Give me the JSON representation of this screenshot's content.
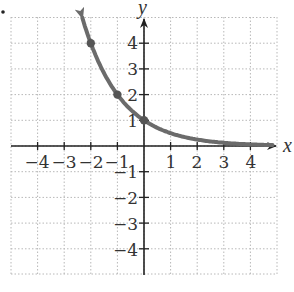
{
  "chart_data": {
    "type": "line",
    "title": "",
    "function": "y = (1/2)^x",
    "xlabel": "x",
    "ylabel": "y",
    "xlim": [
      -5,
      5
    ],
    "ylim": [
      -5,
      5
    ],
    "grid": true,
    "grid_style": "dotted",
    "x_ticks": [
      -4,
      -3,
      -2,
      -1,
      1,
      2,
      3,
      4
    ],
    "y_ticks": [
      -4,
      -3,
      -2,
      -1,
      1,
      2,
      3,
      4
    ],
    "x_tick_labels": [
      "−4",
      "−3",
      "−2",
      "−1",
      "1",
      "2",
      "3",
      "4"
    ],
    "y_tick_labels": [
      "4",
      "3",
      "2",
      "1",
      "−1",
      "−2",
      "−3",
      "−4"
    ],
    "series": [
      {
        "name": "curve",
        "color": "#6b6b6b",
        "x": [
          -2.3,
          -2,
          -1.5,
          -1,
          -0.5,
          0,
          0.5,
          1,
          1.5,
          2,
          2.5,
          3,
          3.5,
          4,
          4.5
        ],
        "values": [
          4.92,
          4,
          2.83,
          2,
          1.41,
          1,
          0.71,
          0.5,
          0.35,
          0.25,
          0.18,
          0.125,
          0.09,
          0.06,
          0.04
        ]
      }
    ],
    "marked_points": [
      {
        "x": -2,
        "y": 4
      },
      {
        "x": -1,
        "y": 2
      },
      {
        "x": 0,
        "y": 1
      }
    ],
    "arrows": [
      "upper-left end of curve",
      "right end of x-axis",
      "top of y-axis"
    ]
  },
  "labels": {
    "x_axis": "x",
    "y_axis": "y",
    "xticks": {
      "n4": "−4",
      "n3": "−3",
      "n2": "−2",
      "n1": "−1",
      "p1": "1",
      "p2": "2",
      "p3": "3",
      "p4": "4"
    },
    "yticks": {
      "p4": "4",
      "p3": "3",
      "p2": "2",
      "p1": "1",
      "n1": "−1",
      "n2": "−2",
      "n3": "−3",
      "n4": "−4"
    }
  },
  "colors": {
    "curve": "#6b6b6b",
    "axis": "#222222",
    "grid": "#b8b8b8",
    "text": "#333333"
  }
}
